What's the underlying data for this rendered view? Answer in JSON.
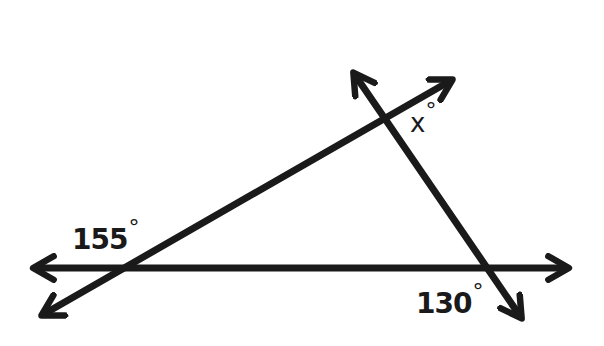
{
  "diagram": {
    "type": "geometry-angles",
    "stroke_color": "#1a1a1a",
    "background": "#ffffff",
    "lines": [
      {
        "id": "horizontal-line",
        "from": [
          32,
          268
        ],
        "to": [
          572,
          268
        ],
        "arrows": "both"
      },
      {
        "id": "rising-line",
        "from": [
          40,
          316
        ],
        "to": [
          455,
          78
        ],
        "arrows": "both"
      },
      {
        "id": "falling-line",
        "from": [
          352,
          70
        ],
        "to": [
          525,
          322
        ],
        "arrows": "both"
      }
    ],
    "labels": {
      "angle_left": {
        "value": "155",
        "unit": "°"
      },
      "angle_top": {
        "value": "x",
        "unit": "°"
      },
      "angle_right": {
        "value": "130",
        "unit": "°"
      }
    }
  }
}
